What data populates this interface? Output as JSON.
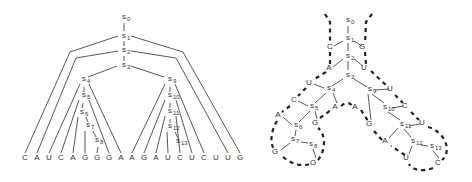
{
  "left_tree": {
    "nodes": [
      {
        "id": "s0",
        "label": "s",
        "sub": "0",
        "x": 122,
        "y": 19
      },
      {
        "id": "s1",
        "label": "s",
        "sub": "1",
        "x": 122,
        "y": 38
      },
      {
        "id": "s2",
        "label": "s",
        "sub": "2",
        "x": 122,
        "y": 52
      },
      {
        "id": "s3",
        "label": "s",
        "sub": "3",
        "x": 122,
        "y": 67
      },
      {
        "id": "s4",
        "label": "s",
        "sub": "4",
        "x": 82,
        "y": 81
      },
      {
        "id": "s5",
        "label": "s",
        "sub": "5",
        "x": 82,
        "y": 97
      },
      {
        "id": "s6",
        "label": "s",
        "sub": "6",
        "x": 80,
        "y": 114
      },
      {
        "id": "s7",
        "label": "s",
        "sub": "7",
        "x": 86,
        "y": 127
      },
      {
        "id": "s8",
        "label": "s",
        "sub": "8",
        "x": 95,
        "y": 142
      },
      {
        "id": "s9",
        "label": "s",
        "sub": "9",
        "x": 168,
        "y": 81
      },
      {
        "id": "s10",
        "label": "s",
        "sub": "10",
        "x": 168,
        "y": 97
      },
      {
        "id": "s11",
        "label": "s",
        "sub": "11",
        "x": 168,
        "y": 113
      },
      {
        "id": "s12",
        "label": "s",
        "sub": "12",
        "x": 168,
        "y": 128
      },
      {
        "id": "s13",
        "label": "s",
        "sub": "13",
        "x": 176,
        "y": 143
      }
    ],
    "sequence": [
      "C",
      "A",
      "U",
      "C",
      "A",
      "G",
      "G",
      "G",
      "A",
      "A",
      "G",
      "A",
      "U",
      "C",
      "U",
      "C",
      "U",
      "U",
      "G"
    ],
    "sequence_x": [
      25,
      37,
      49,
      61,
      73,
      85,
      97,
      109,
      121,
      132,
      144,
      156,
      168,
      180,
      192,
      204,
      216,
      228,
      240
    ],
    "sequence_y": 160
  },
  "right_structure": {
    "states": [
      {
        "id": "s0",
        "label": "s",
        "sub": "0",
        "x": 346,
        "y": 22
      },
      {
        "id": "s1",
        "label": "s",
        "sub": "1",
        "x": 346,
        "y": 40
      },
      {
        "id": "s2",
        "label": "s",
        "sub": "2",
        "x": 346,
        "y": 58
      },
      {
        "id": "s3",
        "label": "s",
        "sub": "3",
        "x": 346,
        "y": 77
      },
      {
        "id": "s4",
        "label": "s",
        "sub": "4",
        "x": 327,
        "y": 90
      },
      {
        "id": "s5",
        "label": "s",
        "sub": "5",
        "x": 310,
        "y": 108
      },
      {
        "id": "s6",
        "label": "s",
        "sub": "6",
        "x": 294,
        "y": 127
      },
      {
        "id": "s7",
        "label": "s",
        "sub": "7",
        "x": 291,
        "y": 141
      },
      {
        "id": "s8",
        "label": "s",
        "sub": "8",
        "x": 309,
        "y": 146
      },
      {
        "id": "s9",
        "label": "s",
        "sub": "9",
        "x": 368,
        "y": 91
      },
      {
        "id": "s10",
        "label": "s",
        "sub": "10",
        "x": 383,
        "y": 109
      },
      {
        "id": "s11",
        "label": "s",
        "sub": "11",
        "x": 400,
        "y": 126
      },
      {
        "id": "s12",
        "label": "s",
        "sub": "12",
        "x": 411,
        "y": 143
      },
      {
        "id": "s13",
        "label": "s",
        "sub": "13",
        "x": 430,
        "y": 148
      }
    ],
    "bases": [
      {
        "b": "C",
        "x": 330,
        "y": 49
      },
      {
        "b": "G",
        "x": 362,
        "y": 49
      },
      {
        "b": "A",
        "x": 329,
        "y": 70
      },
      {
        "b": "U",
        "x": 364,
        "y": 70
      },
      {
        "b": "U",
        "x": 309,
        "y": 85
      },
      {
        "b": "U",
        "x": 390,
        "y": 91
      },
      {
        "b": "C",
        "x": 294,
        "y": 102
      },
      {
        "b": "A",
        "x": 335,
        "y": 109
      },
      {
        "b": "A",
        "x": 355,
        "y": 109
      },
      {
        "b": "A",
        "x": 278,
        "y": 117
      },
      {
        "b": "G",
        "x": 315,
        "y": 125
      },
      {
        "b": "C",
        "x": 405,
        "y": 108
      },
      {
        "b": "G",
        "x": 369,
        "y": 126
      },
      {
        "b": "U",
        "x": 422,
        "y": 125
      },
      {
        "b": "A",
        "x": 385,
        "y": 143
      },
      {
        "b": "G",
        "x": 275,
        "y": 154
      },
      {
        "b": "G",
        "x": 313,
        "y": 165
      },
      {
        "b": "U",
        "x": 406,
        "y": 160
      },
      {
        "b": "C",
        "x": 438,
        "y": 165
      }
    ]
  }
}
